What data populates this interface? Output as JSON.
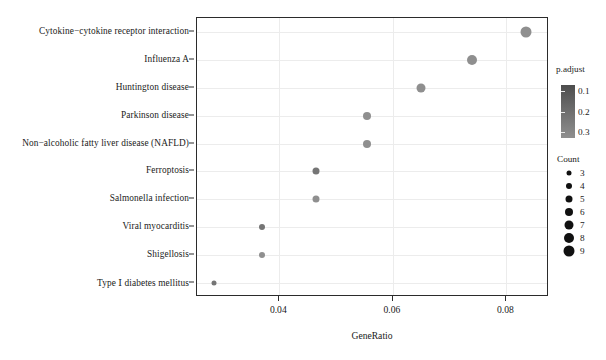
{
  "chart_data": {
    "type": "scatter",
    "title": "",
    "xlabel": "GeneRatio",
    "ylabel": "",
    "xlim": [
      0.0255,
      0.0875
    ],
    "xticks": [
      0.04,
      0.06,
      0.08
    ],
    "xticklabels": [
      "0.04",
      "0.06",
      "0.08"
    ],
    "grid": true,
    "categories": [
      "Cytokine−cytokine receptor interaction",
      "Influenza A",
      "Huntington disease",
      "Parkinson disease",
      "Non−alcoholic fatty liver disease (NAFLD)",
      "Ferroptosis",
      "Salmonella infection",
      "Viral myocarditis",
      "Shigellosis",
      "Type Ⅰ diabetes mellitus"
    ],
    "points": [
      {
        "label": "Cytokine−cytokine receptor interaction",
        "GeneRatio": 0.0835,
        "Count": 9,
        "p.adjust": 0.3
      },
      {
        "label": "Influenza A",
        "GeneRatio": 0.074,
        "Count": 8,
        "p.adjust": 0.3
      },
      {
        "label": "Huntington disease",
        "GeneRatio": 0.065,
        "Count": 7,
        "p.adjust": 0.3
      },
      {
        "label": "Parkinson disease",
        "GeneRatio": 0.0555,
        "Count": 6,
        "p.adjust": 0.3
      },
      {
        "label": "Non−alcoholic fatty liver disease (NAFLD)",
        "GeneRatio": 0.0555,
        "Count": 6,
        "p.adjust": 0.3
      },
      {
        "label": "Ferroptosis",
        "GeneRatio": 0.0465,
        "Count": 5,
        "p.adjust": 0.22
      },
      {
        "label": "Salmonella infection",
        "GeneRatio": 0.0465,
        "Count": 5,
        "p.adjust": 0.3
      },
      {
        "label": "Viral myocarditis",
        "GeneRatio": 0.037,
        "Count": 4,
        "p.adjust": 0.22
      },
      {
        "label": "Shigellosis",
        "GeneRatio": 0.037,
        "Count": 4,
        "p.adjust": 0.3
      },
      {
        "label": "Type Ⅰ diabetes mellitus",
        "GeneRatio": 0.0285,
        "Count": 3,
        "p.adjust": 0.22
      }
    ],
    "legends": {
      "color": {
        "title": "p.adjust",
        "ticks": [
          0.1,
          0.2,
          0.3
        ],
        "ticklabels": [
          "0.1",
          "0.2",
          "0.3"
        ],
        "gradient_high": "#4d4d4d",
        "gradient_low": "#8f8f8f"
      },
      "size": {
        "title": "Count",
        "values": [
          3,
          4,
          5,
          6,
          7,
          8,
          9
        ],
        "labels": [
          "3",
          "4",
          "5",
          "6",
          "7",
          "8",
          "9"
        ]
      }
    },
    "dot_color": "#3f3f3f"
  }
}
